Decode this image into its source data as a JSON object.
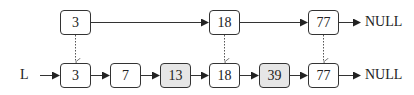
{
  "diagram": {
    "type": "skip-list",
    "list_label": "L",
    "null_label": "NULL",
    "colors": {
      "stroke": "#333333",
      "shaded_fill": "#e6e6e6",
      "node_fill": "#ffffff"
    },
    "top_level": {
      "nodes": [
        {
          "value": "3",
          "shaded": false
        },
        {
          "value": "18",
          "shaded": false
        },
        {
          "value": "77",
          "shaded": false
        }
      ]
    },
    "bottom_level": {
      "nodes": [
        {
          "value": "3",
          "shaded": false
        },
        {
          "value": "7",
          "shaded": false
        },
        {
          "value": "13",
          "shaded": true
        },
        {
          "value": "18",
          "shaded": false
        },
        {
          "value": "39",
          "shaded": true
        },
        {
          "value": "77",
          "shaded": false
        }
      ]
    },
    "vertical_links": [
      "3",
      "18",
      "77"
    ]
  }
}
